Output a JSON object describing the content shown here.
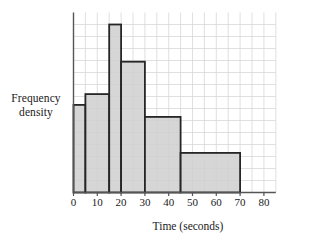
{
  "chart_data": {
    "type": "bar",
    "title": "",
    "subtitle": "",
    "xlabel": "Time (seconds)",
    "ylabel": "Frequency density",
    "ylabel_lines": [
      "Frequency",
      "density"
    ],
    "xlim": [
      0,
      85
    ],
    "ylim": [
      0,
      14
    ],
    "grid": true,
    "grid_step_x": 5,
    "grid_step_y": 1,
    "xticks": [
      0,
      10,
      20,
      30,
      40,
      50,
      60,
      70,
      80
    ],
    "xtick_labels": [
      "0",
      "10",
      "20",
      "30",
      "40",
      "50",
      "60",
      "70",
      "80"
    ],
    "yticks": [],
    "ytick_labels": [],
    "legend": null,
    "bin_edges": [
      0,
      5,
      15,
      20,
      30,
      45,
      70
    ],
    "bins": [
      {
        "label": "0-5",
        "x0": 0,
        "x1": 5,
        "frequency_density": 7.3
      },
      {
        "label": "5-15",
        "x0": 5,
        "x1": 15,
        "frequency_density": 8.2
      },
      {
        "label": "15-20",
        "x0": 15,
        "x1": 20,
        "frequency_density": 14.0
      },
      {
        "label": "20-30",
        "x0": 20,
        "x1": 30,
        "frequency_density": 10.9
      },
      {
        "label": "30-45",
        "x0": 30,
        "x1": 45,
        "frequency_density": 6.3
      },
      {
        "label": "45-70",
        "x0": 45,
        "x1": 70,
        "frequency_density": 3.3
      }
    ],
    "values": [
      7.3,
      8.2,
      14.0,
      10.9,
      6.3,
      3.3
    ],
    "categories": [
      "0-5",
      "5-15",
      "15-20",
      "20-30",
      "30-45",
      "45-70"
    ]
  },
  "style": {
    "bar_fill": "#cfcfcf",
    "bar_edge": "#262626",
    "grid_color": "#d8d8d8",
    "axis_color": "#555555",
    "text_color": "#1a1a1a",
    "background": "#ffffff"
  }
}
